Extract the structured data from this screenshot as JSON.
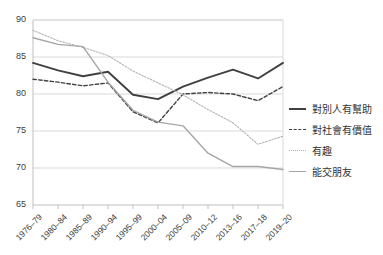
{
  "chart_data": {
    "type": "line",
    "title": "",
    "xlabel": "",
    "ylabel": "",
    "ylim": [
      65,
      90
    ],
    "yticks": [
      65,
      70,
      75,
      80,
      85,
      90
    ],
    "grid": "horizontal",
    "legend_position": "right",
    "categories": [
      "1976–79",
      "1980–84",
      "1985–89",
      "1990–94",
      "1995–99",
      "2000–04",
      "2005–09",
      "2010–12",
      "2013–16",
      "2017–18",
      "2019–20"
    ],
    "series": [
      {
        "name": "對別人有幫助",
        "style": "solid",
        "color": "#404040",
        "values": [
          84.2,
          83.2,
          82.4,
          83.0,
          79.9,
          79.3,
          81.0,
          82.2,
          83.3,
          82.1,
          84.2
        ]
      },
      {
        "name": "對社會有價值",
        "style": "dashed",
        "color": "#404040",
        "values": [
          82.0,
          81.6,
          81.1,
          81.5,
          77.6,
          76.1,
          80.0,
          80.2,
          80.0,
          79.1,
          81.0
        ]
      },
      {
        "name": "有趣",
        "style": "dotted",
        "color": "#b2b2b2",
        "values": [
          88.6,
          87.2,
          86.3,
          85.2,
          83.1,
          81.5,
          79.9,
          77.9,
          76.1,
          73.2,
          74.3
        ]
      },
      {
        "name": "能交朋友",
        "style": "solid",
        "color": "#a6a6a6",
        "values": [
          87.6,
          86.7,
          86.4,
          81.6,
          77.8,
          76.2,
          75.7,
          72.0,
          70.2,
          70.2,
          69.8
        ]
      }
    ]
  },
  "legend": {
    "items": [
      {
        "label": "對別人有幫助"
      },
      {
        "label": "對社會有價值"
      },
      {
        "label": "有趣"
      },
      {
        "label": "能交朋友"
      }
    ]
  },
  "axes": {
    "y_labels": [
      "90",
      "85",
      "80",
      "75",
      "70",
      "65"
    ],
    "x_labels": [
      "1976–79",
      "1980–84",
      "1985–89",
      "1990–94",
      "1995–99",
      "2000–04",
      "2005–09",
      "2010–12",
      "2013–16",
      "2017–18",
      "2019–20"
    ]
  },
  "colors": {
    "grid": "#d9d9d9",
    "axis": "#bfbfbf",
    "text": "#3b3b3b",
    "series_dark": "#404040",
    "series_light": "#a6a6a6",
    "series_dotted": "#b2b2b2"
  }
}
